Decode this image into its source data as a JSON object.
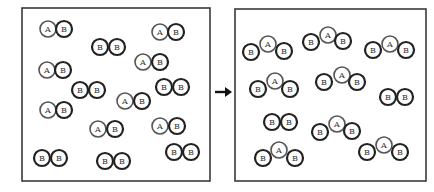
{
  "diagram": {
    "atom_radius": 8,
    "colors": {
      "box_stroke": "#3a3a3a",
      "atom_a_stroke": "#555555",
      "atom_b_stroke": "#222222",
      "arrow": "#111111"
    },
    "left_box": {
      "x": 22,
      "y": 8,
      "width": 188,
      "height": 173,
      "molecules": [
        {
          "type": "AB",
          "atoms": [
            {
              "label": "A",
              "x": 48,
              "y": 29
            },
            {
              "label": "B",
              "x": 64,
              "y": 29
            }
          ]
        },
        {
          "type": "AB",
          "atoms": [
            {
              "label": "A",
              "x": 160,
              "y": 32
            },
            {
              "label": "B",
              "x": 176,
              "y": 32
            }
          ]
        },
        {
          "type": "BB",
          "atoms": [
            {
              "label": "B",
              "x": 100,
              "y": 47
            },
            {
              "label": "B",
              "x": 117,
              "y": 47
            }
          ]
        },
        {
          "type": "AB",
          "atoms": [
            {
              "label": "A",
              "x": 143,
              "y": 62
            },
            {
              "label": "B",
              "x": 160,
              "y": 62
            }
          ]
        },
        {
          "type": "AB",
          "atoms": [
            {
              "label": "A",
              "x": 47,
              "y": 70
            },
            {
              "label": "B",
              "x": 63,
              "y": 70
            }
          ]
        },
        {
          "type": "BB",
          "atoms": [
            {
              "label": "B",
              "x": 80,
              "y": 90
            },
            {
              "label": "B",
              "x": 97,
              "y": 90
            }
          ]
        },
        {
          "type": "BB",
          "atoms": [
            {
              "label": "B",
              "x": 164,
              "y": 87
            },
            {
              "label": "B",
              "x": 181,
              "y": 87
            }
          ]
        },
        {
          "type": "AB",
          "atoms": [
            {
              "label": "A",
              "x": 125,
              "y": 101
            },
            {
              "label": "B",
              "x": 142,
              "y": 101
            }
          ]
        },
        {
          "type": "AB",
          "atoms": [
            {
              "label": "A",
              "x": 48,
              "y": 110
            },
            {
              "label": "B",
              "x": 64,
              "y": 110
            }
          ]
        },
        {
          "type": "AB",
          "atoms": [
            {
              "label": "A",
              "x": 98,
              "y": 129
            },
            {
              "label": "B",
              "x": 115,
              "y": 129
            }
          ]
        },
        {
          "type": "AB",
          "atoms": [
            {
              "label": "A",
              "x": 160,
              "y": 126
            },
            {
              "label": "B",
              "x": 177,
              "y": 126
            }
          ]
        },
        {
          "type": "BB",
          "atoms": [
            {
              "label": "B",
              "x": 42,
              "y": 158
            },
            {
              "label": "B",
              "x": 59,
              "y": 158
            }
          ]
        },
        {
          "type": "BB",
          "atoms": [
            {
              "label": "B",
              "x": 105,
              "y": 161
            },
            {
              "label": "B",
              "x": 122,
              "y": 161
            }
          ]
        },
        {
          "type": "BB",
          "atoms": [
            {
              "label": "B",
              "x": 174,
              "y": 152
            },
            {
              "label": "B",
              "x": 191,
              "y": 152
            }
          ]
        }
      ]
    },
    "arrow": {
      "x1": 215,
      "y1": 92,
      "x2": 232,
      "y2": 92
    },
    "right_box": {
      "x": 235,
      "y": 9,
      "width": 191,
      "height": 172,
      "molecules": [
        {
          "type": "BAB",
          "atoms": [
            {
              "label": "B",
              "x": 251,
              "y": 52
            },
            {
              "label": "A",
              "x": 268,
              "y": 44
            },
            {
              "label": "B",
              "x": 284,
              "y": 51
            }
          ]
        },
        {
          "type": "BAB",
          "atoms": [
            {
              "label": "B",
              "x": 311,
              "y": 42
            },
            {
              "label": "A",
              "x": 328,
              "y": 35
            },
            {
              "label": "B",
              "x": 343,
              "y": 41
            }
          ]
        },
        {
          "type": "BAB",
          "atoms": [
            {
              "label": "B",
              "x": 373,
              "y": 50
            },
            {
              "label": "A",
              "x": 390,
              "y": 44
            },
            {
              "label": "B",
              "x": 406,
              "y": 50
            }
          ]
        },
        {
          "type": "BAB",
          "atoms": [
            {
              "label": "B",
              "x": 258,
              "y": 89
            },
            {
              "label": "A",
              "x": 275,
              "y": 81
            },
            {
              "label": "B",
              "x": 290,
              "y": 89
            }
          ]
        },
        {
          "type": "BAB",
          "atoms": [
            {
              "label": "B",
              "x": 324,
              "y": 82
            },
            {
              "label": "A",
              "x": 342,
              "y": 75
            },
            {
              "label": "B",
              "x": 357,
              "y": 82
            }
          ]
        },
        {
          "type": "BB",
          "atoms": [
            {
              "label": "B",
              "x": 388,
              "y": 97
            },
            {
              "label": "B",
              "x": 405,
              "y": 97
            }
          ]
        },
        {
          "type": "BB",
          "atoms": [
            {
              "label": "B",
              "x": 272,
              "y": 122
            },
            {
              "label": "B",
              "x": 289,
              "y": 122
            }
          ]
        },
        {
          "type": "BAB",
          "atoms": [
            {
              "label": "B",
              "x": 320,
              "y": 132
            },
            {
              "label": "A",
              "x": 337,
              "y": 124
            },
            {
              "label": "B",
              "x": 352,
              "y": 131
            }
          ]
        },
        {
          "type": "BAB",
          "atoms": [
            {
              "label": "B",
              "x": 263,
              "y": 158
            },
            {
              "label": "A",
              "x": 279,
              "y": 150
            },
            {
              "label": "B",
              "x": 295,
              "y": 158
            }
          ]
        },
        {
          "type": "BAB",
          "atoms": [
            {
              "label": "B",
              "x": 367,
              "y": 152
            },
            {
              "label": "A",
              "x": 384,
              "y": 145
            },
            {
              "label": "B",
              "x": 400,
              "y": 152
            }
          ]
        }
      ]
    }
  }
}
